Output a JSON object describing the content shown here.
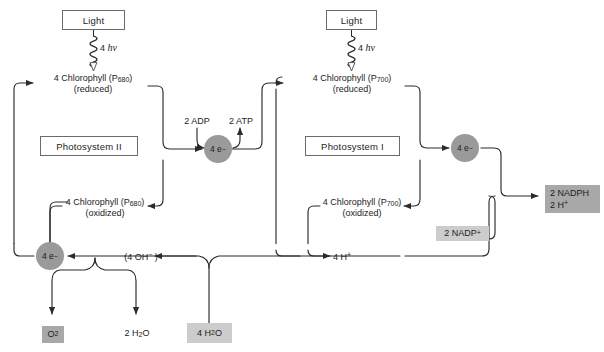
{
  "diagram": {
    "colors": {
      "line": "#2b2b2b",
      "box_border": "#6b6b6b",
      "shade_dark": "#a8a8a8",
      "shade_light": "#cccccc",
      "electron_circle": "#9a9a9a",
      "background": "#ffffff"
    },
    "photosystem_ii": {
      "light_box": "Light",
      "photon_label_count": "4",
      "photon_label_symbol": "hv",
      "chlorophyll_reduced_line1": "4 Chlorophyll (P680)",
      "chlorophyll_reduced_line2": "(reduced)",
      "chlorophyll_reduced_name": "4 Chlorophyll (P",
      "chlorophyll_reduced_sub": "680",
      "chlorophyll_reduced_tail": ")",
      "ps_box": "Photosystem II",
      "chlorophyll_oxidized_line2": "(oxidized)"
    },
    "photosystem_i": {
      "light_box": "Light",
      "photon_label_count": "4",
      "photon_label_symbol": "hv",
      "chlorophyll_reduced_name": "4 Chlorophyll (P",
      "chlorophyll_reduced_sub": "700",
      "chlorophyll_reduced_tail": ")",
      "chlorophyll_reduced_line2": "(reduced)",
      "ps_box": "Photosystem I",
      "chlorophyll_oxidized_line2": "(oxidized)"
    },
    "electron_carriers": {
      "ps2_node": "4 e",
      "ps2_node_charge": "−",
      "ps1_node": "4 e",
      "ps1_node_charge": "−",
      "water_node": "4 e",
      "water_node_charge": "−"
    },
    "atp_synthesis": {
      "substrate": "2 ADP",
      "product": "2 ATP"
    },
    "nadp_reduction": {
      "substrate": "2 NADP",
      "substrate_charge": "+",
      "product_line1": "2 NADPH",
      "product_line2a": "2 H",
      "product_line2b": "+"
    },
    "water_splitting": {
      "input_box_num": "4 H",
      "input_box_sub": "2",
      "input_box_tail": "O",
      "hydroxide_label": "(4 OH",
      "hydroxide_charge": "−",
      "hydroxide_tail": " )",
      "proton_label": "4 H",
      "proton_charge": "+",
      "oxygen_box": "O",
      "oxygen_box_sub": "2",
      "water_out_num": "2 H",
      "water_out_sub": "2",
      "water_out_tail": "O"
    }
  }
}
